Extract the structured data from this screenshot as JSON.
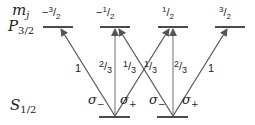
{
  "labels": {
    "mj": "m",
    "mj_sub": "j",
    "upper_state": "P",
    "upper_state_sub": "3/2",
    "lower_state": "S",
    "lower_state_sub": "1/2"
  },
  "upper_levels": [
    {
      "sign": "−",
      "num": "3",
      "den": "2"
    },
    {
      "sign": "−",
      "num": "1",
      "den": "2"
    },
    {
      "sign": "",
      "num": "1",
      "den": "2"
    },
    {
      "sign": "",
      "num": "3",
      "den": "2"
    }
  ],
  "transitions": [
    {
      "from": "-1/2",
      "to": "-3/2",
      "strength": "1",
      "polarization": "σ−"
    },
    {
      "from": "-1/2",
      "to": "-1/2",
      "strength_num": "2",
      "strength_den": "3",
      "polarization": "π"
    },
    {
      "from": "-1/2",
      "to": "1/2",
      "strength_num": "1",
      "strength_den": "3",
      "polarization": "σ+"
    },
    {
      "from": "1/2",
      "to": "-1/2",
      "strength_num": "1",
      "strength_den": "3",
      "polarization": "σ−"
    },
    {
      "from": "1/2",
      "to": "1/2",
      "strength_num": "2",
      "strength_den": "3",
      "polarization": "π"
    },
    {
      "from": "1/2",
      "to": "3/2",
      "strength": "1",
      "polarization": "σ+"
    }
  ],
  "polarization_labels": {
    "sigma": "σ",
    "minus": "−",
    "plus": "+"
  }
}
